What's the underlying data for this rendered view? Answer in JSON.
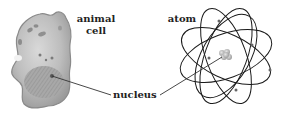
{
  "labels": {
    "cell": "animal cell",
    "cell_line1": "animal",
    "cell_line2": "cell",
    "atom": "atom",
    "nucleus": "nucleus"
  },
  "figures": {
    "cell": {
      "name": "animal cell",
      "has_nucleus": true
    },
    "atom": {
      "name": "atom",
      "electron_orbits": 5,
      "has_nucleus": true
    }
  },
  "colors": {
    "background": "#ffffff",
    "cell_fill": "#b8b8b8",
    "cell_edge": "#8a8a8a",
    "orbit_stroke": "#1a1a1a",
    "leader_line": "#333333",
    "text": "#222222"
  }
}
